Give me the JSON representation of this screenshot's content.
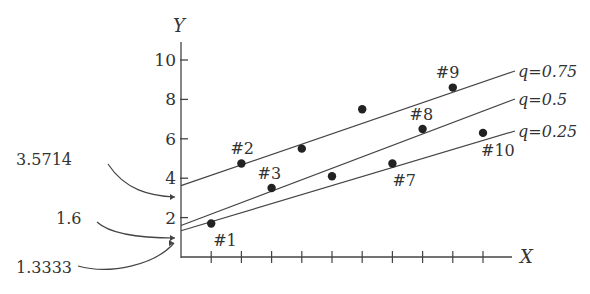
{
  "chart_data": {
    "type": "scatter",
    "title": "",
    "xlabel": "X",
    "ylabel": "Y",
    "y_ticks": [
      "2",
      "4",
      "6",
      "8",
      "10"
    ],
    "x_tick_count": 10,
    "xlim": [
      0,
      11.5
    ],
    "ylim": [
      0,
      11
    ],
    "grid": false,
    "points": [
      {
        "label": "#1",
        "x": 1,
        "y": 1.7
      },
      {
        "label": "#2",
        "x": 2,
        "y": 4.75
      },
      {
        "label": "#3",
        "x": 3,
        "y": 3.5
      },
      {
        "label": "",
        "x": 4,
        "y": 5.5
      },
      {
        "label": "",
        "x": 5,
        "y": 4.1
      },
      {
        "label": "",
        "x": 6,
        "y": 7.5
      },
      {
        "label": "#7",
        "x": 7,
        "y": 4.75
      },
      {
        "label": "#8",
        "x": 8,
        "y": 6.5
      },
      {
        "label": "#9",
        "x": 9,
        "y": 8.6
      },
      {
        "label": "#10",
        "x": 10,
        "y": 6.3
      }
    ],
    "series": [
      {
        "name": "q=0.75",
        "intercept": 3.5714,
        "end_y": 9.1
      },
      {
        "name": "q=0.5",
        "intercept": 1.6,
        "end_y": 7.5
      },
      {
        "name": "q=0.25",
        "intercept": 1.3333,
        "end_y": 5.6
      }
    ],
    "annotations": [
      {
        "text": "3.5714",
        "target": "q=0.75 intercept"
      },
      {
        "text": "1.6",
        "target": "q=0.5 intercept"
      },
      {
        "text": "1.3333",
        "target": "q=0.25 intercept"
      }
    ]
  }
}
